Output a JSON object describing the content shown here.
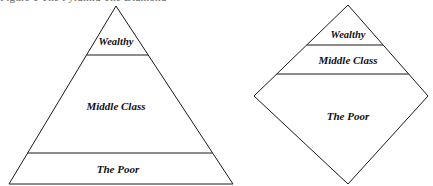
{
  "figure": {
    "clipped_top_caption": "Figure 1   The Pyramid                                 The Diamond",
    "line_color": "#1a1a1a",
    "background_color": "#ffffff",
    "text_color": "#111111"
  },
  "shapes": [
    {
      "id": "pyramid",
      "name": "pyramid",
      "apex": {
        "x": 116,
        "y": 6
      },
      "base_left": {
        "x": 9,
        "y": 184
      },
      "base_right": {
        "x": 233,
        "y": 184
      },
      "dividers_y": [
        55,
        153
      ],
      "bands": [
        {
          "key": "wealthy",
          "label": "Wealthy",
          "center_x": 116,
          "center_y": 43,
          "size": "small"
        },
        {
          "key": "middle_class",
          "label": "Middle Class",
          "center_x": 116,
          "center_y": 107,
          "size": "medium"
        },
        {
          "key": "the_poor",
          "label": "The Poor",
          "center_x": 118,
          "center_y": 170,
          "size": "medium"
        }
      ]
    },
    {
      "id": "diamond",
      "name": "diamond",
      "top": {
        "x": 348,
        "y": 5
      },
      "left": {
        "x": 254,
        "y": 96
      },
      "right": {
        "x": 428,
        "y": 96
      },
      "bottom": {
        "x": 348,
        "y": 184
      },
      "dividers_y": [
        45,
        74
      ],
      "bands": [
        {
          "key": "wealthy",
          "label": "Wealthy",
          "center_x": 348,
          "center_y": 36,
          "size": "small"
        },
        {
          "key": "middle_class",
          "label": "Middle Class",
          "center_x": 348,
          "center_y": 61,
          "size": "medium"
        },
        {
          "key": "the_poor",
          "label": "The Poor",
          "center_x": 348,
          "center_y": 117,
          "size": "medium"
        }
      ]
    }
  ],
  "chart_data": {
    "type": "diagram",
    "subtype": "stratification-shape-comparison",
    "figures": [
      {
        "shape": "triangle",
        "name": "Pyramid",
        "strata": [
          {
            "label": "Wealthy",
            "order": 1,
            "relative_height_pct": 28
          },
          {
            "label": "Middle Class",
            "order": 2,
            "relative_height_pct": 55
          },
          {
            "label": "The Poor",
            "order": 3,
            "relative_height_pct": 17
          }
        ]
      },
      {
        "shape": "diamond",
        "name": "Diamond",
        "strata": [
          {
            "label": "Wealthy",
            "order": 1,
            "relative_height_pct": 22
          },
          {
            "label": "Middle Class",
            "order": 2,
            "relative_height_pct": 16
          },
          {
            "label": "The Poor",
            "order": 3,
            "relative_height_pct": 62
          }
        ]
      }
    ]
  }
}
